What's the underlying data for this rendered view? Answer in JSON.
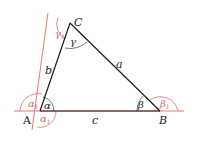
{
  "diagram": {
    "colors": {
      "triangle": "#1a1a1a",
      "extension": "#e07a72",
      "arc_interior": "#555555",
      "arc_exterior": "#d0706a"
    },
    "vertices": {
      "A": "A",
      "B": "B",
      "C": "C"
    },
    "sides": {
      "a": "a",
      "b": "b",
      "c": "c"
    },
    "interior_angles": {
      "alpha": "α",
      "beta": "β",
      "gamma": "γ"
    },
    "exterior_angles": {
      "alpha1_top": "α",
      "alpha1_bottom": "α",
      "beta1": "β",
      "gamma1": "γ",
      "subscript": "1"
    }
  }
}
